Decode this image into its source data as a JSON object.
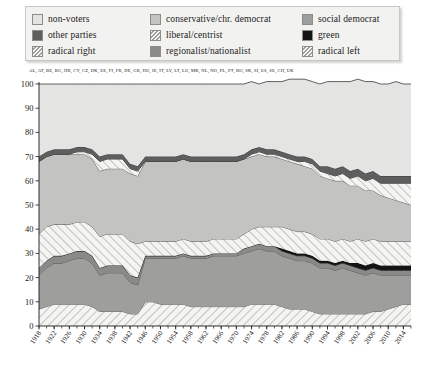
{
  "legend": {
    "items": [
      {
        "label": "non-voters",
        "key": "non_voters",
        "fill": "#e4e4e2",
        "pattern": "solid",
        "col": 0,
        "row": 0
      },
      {
        "label": "other parties",
        "key": "other_parties",
        "fill": "#5e5e5e",
        "pattern": "solid",
        "col": 0,
        "row": 1
      },
      {
        "label": "radical right",
        "key": "radical_right",
        "fill": "#f3f3f1",
        "pattern": "hatch",
        "col": 0,
        "row": 2
      },
      {
        "label": "conservative/chr. democrat",
        "key": "conservative",
        "fill": "#c3c3c1",
        "pattern": "solid",
        "col": 1,
        "row": 0
      },
      {
        "label": "liberal/centrist",
        "key": "liberal",
        "fill": "#f3f3f1",
        "pattern": "hatch",
        "col": 1,
        "row": 1
      },
      {
        "label": "regionalist/nationalist",
        "key": "regionalist",
        "fill": "#8a8a88",
        "pattern": "solid",
        "col": 1,
        "row": 2
      },
      {
        "label": "social democrat",
        "key": "social_democrat",
        "fill": "#9e9e9c",
        "pattern": "solid",
        "col": 2,
        "row": 0
      },
      {
        "label": "green",
        "key": "green",
        "fill": "#141414",
        "pattern": "solid",
        "col": 2,
        "row": 1
      },
      {
        "label": "radical left",
        "key": "radical_left",
        "fill": "#f3f3f1",
        "pattern": "hatch",
        "col": 2,
        "row": 2
      }
    ]
  },
  "countries": "AL, AT, BE, BG, HR, CY, CZ, DK, EE, FI, FR, DE, GR, HU, IE, IT, LV, LT, LU, MK, NL, NO, PL, PT, RO, SK, SI, ES, SE, CH, UK",
  "chart_data": {
    "type": "area",
    "stacked": true,
    "title": "",
    "xlabel": "",
    "ylabel": "",
    "ylim": [
      0,
      100
    ],
    "yticks": [
      0,
      10,
      20,
      30,
      40,
      50,
      60,
      70,
      80,
      90,
      100
    ],
    "xlim": [
      1918,
      2016
    ],
    "xticks": [
      1918,
      1922,
      1926,
      1930,
      1934,
      1938,
      1942,
      1946,
      1950,
      1954,
      1958,
      1962,
      1966,
      1970,
      1974,
      1978,
      1982,
      1986,
      1990,
      1994,
      1998,
      2002,
      2006,
      2010,
      2014
    ],
    "grid": false,
    "legend_position": "top",
    "x": [
      1918,
      1920,
      1922,
      1924,
      1926,
      1928,
      1930,
      1932,
      1934,
      1936,
      1938,
      1940,
      1942,
      1944,
      1946,
      1948,
      1950,
      1952,
      1954,
      1956,
      1958,
      1960,
      1962,
      1964,
      1966,
      1968,
      1970,
      1972,
      1974,
      1976,
      1978,
      1980,
      1982,
      1984,
      1986,
      1988,
      1990,
      1992,
      1994,
      1996,
      1998,
      2000,
      2002,
      2004,
      2006,
      2008,
      2010,
      2012,
      2014,
      2016
    ],
    "series": [
      {
        "name": "radical left",
        "key": "radical_left",
        "values": [
          7,
          8,
          9,
          9,
          9,
          9,
          9,
          8,
          6,
          6,
          6,
          6,
          5,
          5,
          10,
          10,
          9,
          9,
          9,
          9,
          8,
          8,
          8,
          8,
          8,
          8,
          8,
          8,
          9,
          9,
          9,
          9,
          8,
          7,
          7,
          7,
          6,
          5,
          5,
          5,
          5,
          5,
          5,
          5,
          6,
          6,
          7,
          8,
          9,
          9
        ]
      },
      {
        "name": "social democrat",
        "key": "social_democrat",
        "values": [
          14,
          16,
          17,
          17,
          18,
          19,
          19,
          18,
          15,
          16,
          16,
          16,
          13,
          12,
          18,
          18,
          19,
          19,
          19,
          20,
          20,
          20,
          20,
          21,
          21,
          21,
          21,
          22,
          22,
          23,
          22,
          22,
          21,
          21,
          20,
          20,
          20,
          19,
          19,
          18,
          19,
          18,
          17,
          16,
          16,
          15,
          14,
          13,
          12,
          12
        ]
      },
      {
        "name": "regionalist/nationalist",
        "key": "regionalist",
        "values": [
          3,
          3,
          3,
          3,
          3,
          3,
          3,
          3,
          3,
          3,
          3,
          3,
          3,
          3,
          1,
          1,
          1,
          1,
          1,
          1,
          1,
          1,
          1,
          1,
          1,
          1,
          1,
          2,
          2,
          2,
          2,
          2,
          2,
          2,
          2,
          2,
          2,
          2,
          2,
          2,
          2,
          2,
          2,
          2,
          2,
          2,
          2,
          2,
          2,
          2
        ]
      },
      {
        "name": "green",
        "key": "green",
        "values": [
          0,
          0,
          0,
          0,
          0,
          0,
          0,
          0,
          0,
          0,
          0,
          0,
          0,
          0,
          0,
          0,
          0,
          0,
          0,
          0,
          0,
          0,
          0,
          0,
          0,
          0,
          0,
          0,
          0,
          0,
          0,
          0,
          1,
          1,
          1,
          1,
          1,
          1,
          1,
          1,
          1,
          1,
          2,
          2,
          2,
          2,
          2,
          2,
          2,
          2
        ]
      },
      {
        "name": "liberal/centrist",
        "key": "liberal",
        "values": [
          14,
          14,
          13,
          13,
          12,
          12,
          12,
          12,
          13,
          13,
          13,
          13,
          14,
          14,
          6,
          6,
          6,
          6,
          6,
          6,
          6,
          6,
          6,
          6,
          6,
          6,
          6,
          6,
          7,
          7,
          8,
          8,
          9,
          9,
          9,
          9,
          9,
          9,
          9,
          9,
          9,
          9,
          10,
          10,
          10,
          10,
          10,
          10,
          10,
          10
        ]
      },
      {
        "name": "conservative/chr. democrat",
        "key": "conservative",
        "values": [
          30,
          29,
          29,
          29,
          29,
          28,
          28,
          28,
          27,
          27,
          27,
          27,
          28,
          28,
          33,
          33,
          33,
          33,
          33,
          33,
          33,
          33,
          33,
          32,
          32,
          32,
          32,
          31,
          30,
          30,
          29,
          29,
          28,
          28,
          28,
          27,
          27,
          26,
          25,
          25,
          24,
          23,
          22,
          21,
          20,
          19,
          18,
          17,
          16,
          15
        ]
      },
      {
        "name": "radical right",
        "key": "radical_right",
        "values": [
          0,
          0,
          0,
          0,
          0,
          1,
          1,
          2,
          4,
          4,
          4,
          4,
          2,
          2,
          0,
          0,
          0,
          0,
          0,
          0,
          0,
          0,
          0,
          0,
          0,
          0,
          0,
          0,
          1,
          1,
          1,
          1,
          1,
          1,
          1,
          2,
          2,
          2,
          2,
          2,
          3,
          3,
          4,
          4,
          5,
          5,
          6,
          7,
          8,
          9
        ]
      },
      {
        "name": "other parties",
        "key": "other_parties",
        "values": [
          2,
          2,
          2,
          2,
          2,
          2,
          2,
          2,
          2,
          2,
          2,
          2,
          2,
          2,
          2,
          2,
          2,
          2,
          2,
          2,
          2,
          2,
          2,
          2,
          2,
          2,
          2,
          2,
          2,
          2,
          2,
          2,
          2,
          2,
          2,
          2,
          2,
          2,
          3,
          3,
          3,
          3,
          3,
          3,
          3,
          3,
          3,
          3,
          3,
          3
        ]
      },
      {
        "name": "non-voters",
        "key": "non_voters",
        "values": [
          30,
          28,
          27,
          27,
          27,
          26,
          26,
          27,
          30,
          29,
          29,
          29,
          33,
          34,
          30,
          30,
          30,
          30,
          30,
          29,
          30,
          30,
          30,
          30,
          30,
          30,
          30,
          29,
          28,
          26,
          28,
          28,
          29,
          31,
          32,
          32,
          32,
          34,
          35,
          36,
          35,
          37,
          37,
          38,
          37,
          38,
          38,
          39,
          38,
          38
        ]
      }
    ]
  }
}
